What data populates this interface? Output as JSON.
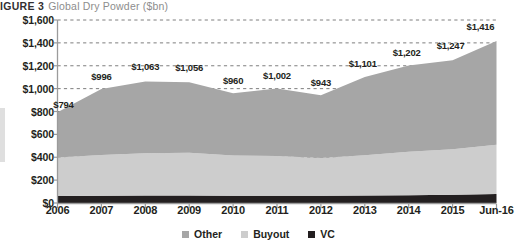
{
  "figure": {
    "number_label": "IGURE 3",
    "title": "Global Dry Powder ($bn)"
  },
  "legend": {
    "position": "bottom-center",
    "items": [
      {
        "label": "Other",
        "color": "#a6a6a6",
        "icon": "square-swatch-icon"
      },
      {
        "label": "Buyout",
        "color": "#cdcdcd",
        "icon": "square-swatch-icon"
      },
      {
        "label": "VC",
        "color": "#231f20",
        "icon": "square-swatch-icon"
      }
    ]
  },
  "chart_data": {
    "type": "area",
    "stacked": true,
    "title": "Global Dry Powder ($bn)",
    "xlabel": "",
    "ylabel": "",
    "categories": [
      "2006",
      "2007",
      "2008",
      "2009",
      "2010",
      "2011",
      "2012",
      "2013",
      "2014",
      "2015",
      "Jun-16"
    ],
    "x": [
      "2006",
      "2007",
      "2008",
      "2009",
      "2010",
      "2011",
      "2012",
      "2013",
      "2014",
      "2015",
      "Jun-16"
    ],
    "ylim": [
      0,
      1600
    ],
    "yticks": [
      0,
      200,
      400,
      600,
      800,
      1000,
      1200,
      1400,
      1600
    ],
    "ytick_labels": [
      "$0",
      "$200",
      "$400",
      "$600",
      "$800",
      "$1,000",
      "$1,200",
      "$1,400",
      "$1,600"
    ],
    "grid": "horizontal-dashed",
    "totals": [
      794,
      996,
      1063,
      1056,
      960,
      1002,
      943,
      1101,
      1202,
      1247,
      1416
    ],
    "total_labels": [
      "$794",
      "$996",
      "$1,063",
      "$1,056",
      "$960",
      "$1,002",
      "$943",
      "$1,101",
      "$1,202",
      "$1,247",
      "$1,416"
    ],
    "series": [
      {
        "name": "VC",
        "color": "#231f20",
        "values": [
          62,
          64,
          66,
          66,
          64,
          64,
          63,
          65,
          68,
          72,
          78
        ]
      },
      {
        "name": "Buyout",
        "color": "#cdcdcd",
        "values": [
          336,
          356,
          370,
          374,
          352,
          348,
          330,
          352,
          380,
          398,
          432
        ]
      },
      {
        "name": "Other",
        "color": "#a6a6a6",
        "values": [
          396,
          576,
          627,
          616,
          544,
          590,
          550,
          684,
          754,
          777,
          906
        ]
      }
    ]
  }
}
